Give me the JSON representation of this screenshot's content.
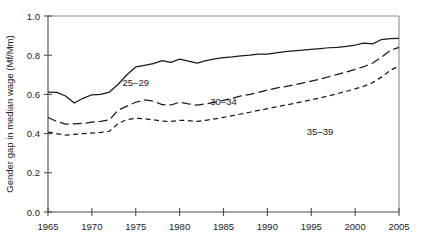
{
  "chart_data": {
    "type": "line",
    "title": "",
    "xlabel": "",
    "ylabel": "Gender gap in median wage (Mf/Mm)",
    "xlim": [
      1965,
      2005
    ],
    "ylim": [
      0.0,
      1.0
    ],
    "xticks": [
      1965,
      1970,
      1975,
      1980,
      1985,
      1990,
      1995,
      2000,
      2005
    ],
    "yticks": [
      0.0,
      0.2,
      0.4,
      0.6,
      0.8,
      1.0
    ],
    "xtick_labels": [
      "1965",
      "1970",
      "1975",
      "1980",
      "1985",
      "1990",
      "1995",
      "2000",
      "2005"
    ],
    "ytick_labels": [
      "0.0",
      "0.2",
      "0.4",
      "0.6",
      "0.8",
      "1.0"
    ],
    "grid": false,
    "legend": "inline-annotations",
    "x": [
      1965,
      1966,
      1967,
      1968,
      1969,
      1970,
      1971,
      1972,
      1973,
      1974,
      1975,
      1976,
      1977,
      1978,
      1979,
      1980,
      1981,
      1982,
      1983,
      1984,
      1985,
      1986,
      1987,
      1988,
      1989,
      1990,
      1991,
      1992,
      1993,
      1994,
      1995,
      1996,
      1997,
      1998,
      1999,
      2000,
      2001,
      2002,
      2003,
      2004,
      2005
    ],
    "series": [
      {
        "name": "25-29",
        "label": "25–29",
        "style": "solid",
        "label_x": 1975.0,
        "label_y": 0.645,
        "values": [
          0.612,
          0.61,
          0.592,
          0.556,
          0.58,
          0.598,
          0.6,
          0.612,
          0.652,
          0.7,
          0.74,
          0.748,
          0.757,
          0.772,
          0.763,
          0.78,
          0.77,
          0.76,
          0.772,
          0.781,
          0.788,
          0.792,
          0.797,
          0.8,
          0.805,
          0.806,
          0.812,
          0.818,
          0.822,
          0.826,
          0.83,
          0.834,
          0.838,
          0.84,
          0.845,
          0.852,
          0.862,
          0.858,
          0.88,
          0.884,
          0.886
        ]
      },
      {
        "name": "30-34",
        "label": "30–34",
        "style": "dashed",
        "label_x": 1985.0,
        "label_y": 0.545,
        "values": [
          0.482,
          0.462,
          0.448,
          0.45,
          0.452,
          0.458,
          0.462,
          0.47,
          0.52,
          0.54,
          0.56,
          0.572,
          0.566,
          0.548,
          0.546,
          0.56,
          0.552,
          0.545,
          0.552,
          0.56,
          0.57,
          0.58,
          0.592,
          0.6,
          0.61,
          0.622,
          0.632,
          0.64,
          0.648,
          0.658,
          0.668,
          0.678,
          0.69,
          0.702,
          0.714,
          0.728,
          0.742,
          0.76,
          0.79,
          0.824,
          0.84
        ]
      },
      {
        "name": "35-39",
        "label": "35–39",
        "style": "dotted-dash",
        "label_x": 1996.0,
        "label_y": 0.392,
        "values": [
          0.408,
          0.4,
          0.392,
          0.396,
          0.4,
          0.403,
          0.406,
          0.412,
          0.452,
          0.472,
          0.478,
          0.476,
          0.47,
          0.464,
          0.462,
          0.468,
          0.466,
          0.462,
          0.468,
          0.475,
          0.483,
          0.492,
          0.5,
          0.509,
          0.518,
          0.527,
          0.536,
          0.545,
          0.554,
          0.563,
          0.572,
          0.582,
          0.593,
          0.604,
          0.616,
          0.628,
          0.642,
          0.66,
          0.688,
          0.722,
          0.745
        ]
      }
    ]
  },
  "figure": {
    "background": "#ffffff",
    "line_color": "#1a1a1a",
    "axis_color": "#4d4d4d",
    "frame_color": "#8c8c8c"
  }
}
